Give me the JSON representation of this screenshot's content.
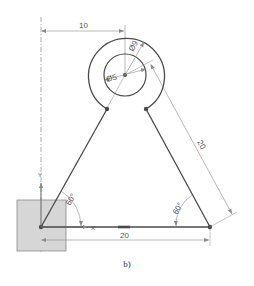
{
  "figure": {
    "caption": "b)",
    "colors": {
      "geometry": "#4a4a4a",
      "dimension": "#8a8a8a",
      "base_fill": "#d6d6d6",
      "base_stroke": "#8a8a8a",
      "axis_dash": "#9a9a9a"
    },
    "dimensions": {
      "horizontal_offset": "10",
      "outer_diameter": "Ø9",
      "inner_diameter": "Ø5",
      "slanted_side": "20",
      "bottom_side": "20",
      "left_angle": "60°",
      "right_angle": "60°"
    },
    "axes": {
      "x_label": "X",
      "y_label": "Y"
    }
  }
}
